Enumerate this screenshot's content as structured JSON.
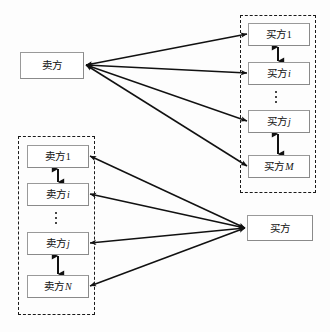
{
  "diagram": {
    "type": "buyer-seller-relationship-diagram",
    "background": "#fdfdfd",
    "line_color": "#111111",
    "dashed_group_color": "#1a1a1a",
    "node_border_color": "#8a8a8a",
    "nodes": {
      "single_seller": {
        "label": "卖方",
        "x": 20,
        "y": 52,
        "w": 64,
        "h": 27
      },
      "single_buyer": {
        "label": "买方",
        "x": 247,
        "y": 215,
        "w": 66,
        "h": 26
      }
    },
    "buyer_group": {
      "name": "buyer-group",
      "x": 240,
      "y": 15,
      "w": 76,
      "h": 178,
      "items": [
        {
          "base": "买方",
          "suffix": "1",
          "suffix_style": "number",
          "x": 248,
          "y": 23,
          "w": 62,
          "h": 23
        },
        {
          "base": "买方",
          "suffix": "i",
          "suffix_style": "italic",
          "x": 248,
          "y": 62,
          "w": 62,
          "h": 23
        },
        {
          "base": "买方",
          "suffix": "j",
          "suffix_style": "italic",
          "x": 248,
          "y": 110,
          "w": 62,
          "h": 23
        },
        {
          "base": "买方",
          "suffix": "M",
          "suffix_style": "italic",
          "x": 248,
          "y": 155,
          "w": 62,
          "h": 23
        }
      ],
      "ellipsis_x": 278,
      "ellipsis_y": 91
    },
    "seller_group": {
      "name": "seller-group",
      "x": 18,
      "y": 136,
      "w": 77,
      "h": 179,
      "items": [
        {
          "base": "卖方",
          "suffix": "1",
          "suffix_style": "number",
          "x": 27,
          "y": 145,
          "w": 62,
          "h": 23
        },
        {
          "base": "卖方",
          "suffix": "i",
          "suffix_style": "italic",
          "x": 27,
          "y": 183,
          "w": 62,
          "h": 23
        },
        {
          "base": "卖方",
          "suffix": "j",
          "suffix_style": "italic",
          "x": 27,
          "y": 232,
          "w": 62,
          "h": 23
        },
        {
          "base": "卖方",
          "suffix": "N",
          "suffix_style": "italic",
          "x": 27,
          "y": 275,
          "w": 62,
          "h": 23
        }
      ],
      "ellipsis_x": 58,
      "ellipsis_y": 212
    },
    "intra_group_links": [
      {
        "name": "buyer1-to-buyeri",
        "x": 278,
        "y1": 46,
        "y2": 62
      },
      {
        "name": "buyerj-to-buyerM",
        "x": 278,
        "y1": 133,
        "y2": 155
      },
      {
        "name": "seller1-to-selleri",
        "x": 58,
        "y1": 168,
        "y2": 183
      },
      {
        "name": "sellerj-to-sellerN",
        "x": 58,
        "y1": 255,
        "y2": 275
      }
    ],
    "seller_to_buyers_edges": [
      {
        "name": "seller-to-buyer1",
        "x1": 86,
        "y1": 65,
        "x2": 247,
        "y2": 34
      },
      {
        "name": "seller-to-buyeri",
        "x1": 86,
        "y1": 65,
        "x2": 247,
        "y2": 73
      },
      {
        "name": "seller-to-buyerj",
        "x1": 86,
        "y1": 65,
        "x2": 247,
        "y2": 121
      },
      {
        "name": "seller-to-buyerM",
        "x1": 86,
        "y1": 65,
        "x2": 247,
        "y2": 166
      }
    ],
    "sellers_to_buyer_edges": [
      {
        "name": "seller1-to-buyer",
        "x1": 90,
        "y1": 156,
        "x2": 245,
        "y2": 228
      },
      {
        "name": "selleri-to-buyer",
        "x1": 90,
        "y1": 194,
        "x2": 245,
        "y2": 228
      },
      {
        "name": "sellerj-to-buyer",
        "x1": 90,
        "y1": 243,
        "x2": 245,
        "y2": 228
      },
      {
        "name": "sellerN-to-buyer",
        "x1": 90,
        "y1": 286,
        "x2": 245,
        "y2": 228
      }
    ]
  }
}
